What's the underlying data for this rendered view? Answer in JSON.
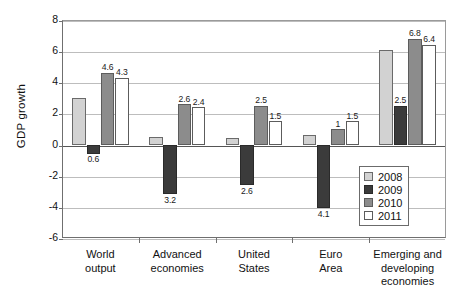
{
  "chart_data": {
    "type": "bar",
    "title": "",
    "xlabel": "",
    "ylabel": "GDP growth",
    "ylim": [
      -6,
      8
    ],
    "yticks": [
      8,
      6,
      4,
      2,
      0,
      -2,
      -4,
      -6
    ],
    "ytick_labels": [
      "8",
      "6",
      "4",
      "2",
      "0",
      "-2",
      "-4",
      "-6"
    ],
    "grid": true,
    "legend_position": "inside-bottom-right",
    "categories": [
      "World\noutput",
      "Advanced\neconomies",
      "United\nStates",
      "Euro\nArea",
      "Emerging and\ndeveloping\neconomies"
    ],
    "series": [
      {
        "name": "2008",
        "color": "#d2d2d2",
        "values": [
          3.0,
          0.5,
          0.4,
          0.6,
          6.1
        ],
        "data_labels": [
          "",
          "",
          "",
          "",
          ""
        ]
      },
      {
        "name": "2009",
        "color": "#3b3b3b",
        "values": [
          -0.6,
          -3.2,
          -2.6,
          -4.1,
          2.5
        ],
        "data_labels": [
          "0.6",
          "3.2",
          "2.6",
          "4.1",
          "2.5"
        ]
      },
      {
        "name": "2010",
        "color": "#8c8c8c",
        "values": [
          4.6,
          2.6,
          2.5,
          1.0,
          6.8
        ],
        "data_labels": [
          "4.6",
          "2.6",
          "2.5",
          "1",
          "6.8"
        ]
      },
      {
        "name": "2011",
        "color": "#ffffff",
        "values": [
          4.3,
          2.4,
          1.5,
          1.5,
          6.4
        ],
        "data_labels": [
          "4.3",
          "2.4",
          "1.5",
          "1.5",
          "6.4"
        ]
      }
    ]
  },
  "legend": {
    "items": [
      {
        "label": "2008"
      },
      {
        "label": "2009"
      },
      {
        "label": "2010"
      },
      {
        "label": "2011"
      }
    ]
  }
}
